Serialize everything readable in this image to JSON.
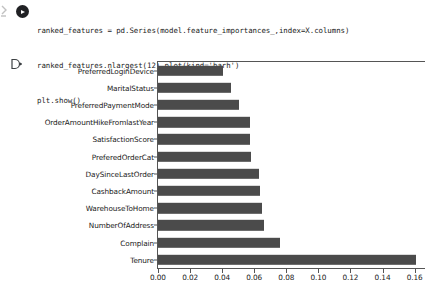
{
  "notebook": {
    "cell_drag_handle_icon": "drag-handle-icon",
    "run_button_label": "Run cell",
    "output_prompt": "output-prompt-marker",
    "code_lines": [
      "ranked_features = pd.Series(model.feature_importances_,index=X.columns)",
      "ranked_features.nlargest(12).plot(kind='barh')",
      "plt.show()"
    ]
  },
  "chart_data": {
    "type": "bar",
    "orientation": "horizontal",
    "title": "",
    "xlabel": "",
    "ylabel": "",
    "xlim": [
      0.0,
      0.168
    ],
    "grid": false,
    "legend": false,
    "bar_color": "#4b4b4b",
    "xticks": [
      "0.00",
      "0.02",
      "0.04",
      "0.06",
      "0.08",
      "0.10",
      "0.12",
      "0.14",
      "0.16"
    ],
    "xtick_values": [
      0.0,
      0.02,
      0.04,
      0.06,
      0.08,
      0.1,
      0.12,
      0.14,
      0.16
    ],
    "categories": [
      "PreferredLoginDevice",
      "MaritalStatus",
      "PreferredPaymentMode",
      "OrderAmountHikeFromlastYear",
      "SatisfactionScore",
      "PreferedOrderCat",
      "DaySinceLastOrder",
      "CashbackAmount",
      "WarehouseToHome",
      "NumberOfAddress",
      "Complain",
      "Tenure"
    ],
    "values": [
      0.0405,
      0.0455,
      0.0503,
      0.0575,
      0.0575,
      0.0577,
      0.0627,
      0.0633,
      0.0648,
      0.0662,
      0.0762,
      0.161
    ]
  }
}
